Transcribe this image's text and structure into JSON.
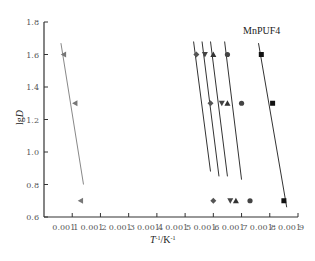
{
  "chart_data": {
    "type": "scatter",
    "title": "",
    "annotation": "MnPUF4",
    "xlabel": "T⁻¹/K⁻¹",
    "ylabel": "lgD",
    "xlim": [
      0.001,
      0.0019
    ],
    "ylim": [
      0.6,
      1.8
    ],
    "x_ticks": [
      0.0011,
      0.0012,
      0.0013,
      0.0014,
      0.0015,
      0.0016,
      0.0017,
      0.0018,
      0.0019
    ],
    "x_tick_labels": [
      "0.001 1",
      "0.001 2",
      "0.001 3",
      "0.001 4",
      "0.001 5",
      "0.001 6",
      "0.001 7",
      "0.001 8",
      "0.001 9"
    ],
    "y_ticks": [
      0.6,
      0.8,
      1.0,
      1.2,
      1.4,
      1.6,
      1.8
    ],
    "y_tick_labels": [
      "0.6",
      "0.8",
      "1.0",
      "1.2",
      "1.4",
      "1.6",
      "1.8"
    ],
    "grid": false,
    "series": [
      {
        "name": "series-1",
        "marker": "triangle-left",
        "color": "#777777",
        "x": [
          0.00107,
          0.00111,
          0.00113
        ],
        "y": [
          1.6,
          1.3,
          0.7
        ],
        "fit": [
          [
            0.00106,
            1.67
          ],
          [
            0.00114,
            0.8
          ]
        ]
      },
      {
        "name": "series-2",
        "marker": "diamond",
        "color": "#555555",
        "x": [
          0.00154,
          0.00159,
          0.0016
        ],
        "y": [
          1.6,
          1.3,
          0.7
        ],
        "fit": [
          [
            0.00153,
            1.68
          ],
          [
            0.00159,
            0.88
          ]
        ]
      },
      {
        "name": "series-3",
        "marker": "triangle-down",
        "color": "#444444",
        "x": [
          0.00157,
          0.00163,
          0.00166
        ],
        "y": [
          1.6,
          1.3,
          0.7
        ],
        "fit": [
          [
            0.00156,
            1.68
          ],
          [
            0.00162,
            0.85
          ]
        ]
      },
      {
        "name": "series-4",
        "marker": "triangle-up",
        "color": "#333333",
        "x": [
          0.0016,
          0.00165,
          0.00168
        ],
        "y": [
          1.6,
          1.3,
          0.7
        ],
        "fit": [
          [
            0.00159,
            1.68
          ],
          [
            0.00165,
            0.85
          ]
        ]
      },
      {
        "name": "series-5",
        "marker": "circle",
        "color": "#444444",
        "x": [
          0.00165,
          0.0017,
          0.00173
        ],
        "y": [
          1.6,
          1.3,
          0.7
        ],
        "fit": [
          [
            0.00164,
            1.68
          ],
          [
            0.0017,
            0.83
          ]
        ]
      },
      {
        "name": "series-6",
        "marker": "square",
        "color": "#111111",
        "x": [
          0.00177,
          0.00181,
          0.00185
        ],
        "y": [
          1.6,
          1.3,
          0.7
        ],
        "fit": [
          [
            0.00176,
            1.67
          ],
          [
            0.00186,
            0.66
          ]
        ]
      }
    ]
  }
}
